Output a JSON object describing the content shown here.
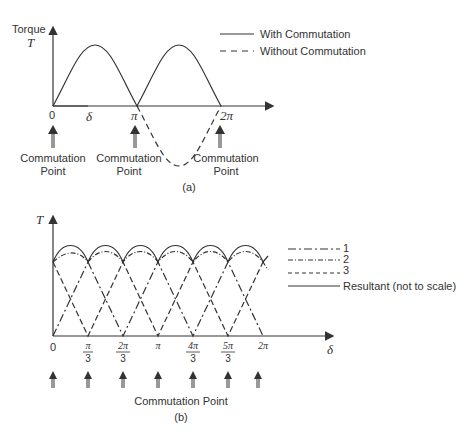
{
  "diagram_a": {
    "y_axis_label_line1": "Torque",
    "y_axis_label_line2": "T",
    "x_axis_label": "δ",
    "ticks": [
      "0",
      "π",
      "2π"
    ],
    "commutation_label_line1": "Commutation",
    "commutation_label_line2": "Point",
    "caption": "(a)",
    "legend": [
      {
        "style": "solid",
        "label": "With Commutation"
      },
      {
        "style": "dashed",
        "label": "Without Commutation"
      }
    ]
  },
  "diagram_b": {
    "y_axis_label": "T",
    "x_axis_label": "δ",
    "ticks": [
      {
        "num": "0",
        "den": ""
      },
      {
        "num": "π",
        "den": "3"
      },
      {
        "num": "2π",
        "den": "3"
      },
      {
        "num": "π",
        "den": ""
      },
      {
        "num": "4π",
        "den": "3"
      },
      {
        "num": "5π",
        "den": "3"
      },
      {
        "num": "2π",
        "den": ""
      }
    ],
    "commutation_label": "Commutation Point",
    "caption": "(b)",
    "legend": [
      {
        "style": "dash-dot",
        "label": "1"
      },
      {
        "style": "dash-dot-dot",
        "label": "2"
      },
      {
        "style": "dashed",
        "label": "3"
      },
      {
        "style": "solid",
        "label": "Resultant (not to scale)"
      }
    ]
  },
  "colors": {
    "line": "#333333",
    "background": "#ffffff"
  }
}
